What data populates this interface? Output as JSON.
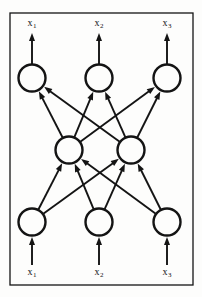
{
  "figure": {
    "kind": "neural-network-diagram",
    "background_color": "#fdfdfc",
    "ink_color": "#141414",
    "frame": {
      "name": "figure-border",
      "x": 10,
      "y": 13,
      "width": 183,
      "height": 272,
      "stroke_width": 1.3
    },
    "style": {
      "node_radius": 13.5,
      "node_stroke_width": 2.4,
      "edge_stroke_width": 1.9,
      "arrow_head_length": 8,
      "arrow_head_width": 6
    },
    "layers": [
      {
        "name": "output-layer",
        "role": "output",
        "y": 78,
        "nodes": [
          {
            "name": "output-node-1",
            "x": 32
          },
          {
            "name": "output-node-2",
            "x": 99
          },
          {
            "name": "output-node-3",
            "x": 167
          }
        ]
      },
      {
        "name": "hidden-layer",
        "role": "hidden",
        "y": 150,
        "nodes": [
          {
            "name": "hidden-node-1",
            "x": 69
          },
          {
            "name": "hidden-node-2",
            "x": 131
          }
        ]
      },
      {
        "name": "input-layer",
        "role": "input",
        "y": 222,
        "nodes": [
          {
            "name": "input-node-1",
            "x": 32
          },
          {
            "name": "input-node-2",
            "x": 99
          },
          {
            "name": "input-node-3",
            "x": 167
          }
        ]
      }
    ],
    "edges": [
      {
        "name": "edge-hidden1-output1",
        "from_layer": 1,
        "from_node": 0,
        "to_layer": 0,
        "to_node": 0
      },
      {
        "name": "edge-hidden1-output2",
        "from_layer": 1,
        "from_node": 0,
        "to_layer": 0,
        "to_node": 1
      },
      {
        "name": "edge-hidden1-output3",
        "from_layer": 1,
        "from_node": 0,
        "to_layer": 0,
        "to_node": 2
      },
      {
        "name": "edge-hidden2-output1",
        "from_layer": 1,
        "from_node": 1,
        "to_layer": 0,
        "to_node": 0
      },
      {
        "name": "edge-hidden2-output2",
        "from_layer": 1,
        "from_node": 1,
        "to_layer": 0,
        "to_node": 1
      },
      {
        "name": "edge-hidden2-output3",
        "from_layer": 1,
        "from_node": 1,
        "to_layer": 0,
        "to_node": 2
      },
      {
        "name": "edge-input1-hidden1",
        "from_layer": 2,
        "from_node": 0,
        "to_layer": 1,
        "to_node": 0
      },
      {
        "name": "edge-input1-hidden2",
        "from_layer": 2,
        "from_node": 0,
        "to_layer": 1,
        "to_node": 1
      },
      {
        "name": "edge-input2-hidden1",
        "from_layer": 2,
        "from_node": 1,
        "to_layer": 1,
        "to_node": 0
      },
      {
        "name": "edge-input2-hidden2",
        "from_layer": 2,
        "from_node": 1,
        "to_layer": 1,
        "to_node": 1
      },
      {
        "name": "edge-input3-hidden1",
        "from_layer": 2,
        "from_node": 2,
        "to_layer": 1,
        "to_node": 0
      },
      {
        "name": "edge-input3-hidden2",
        "from_layer": 2,
        "from_node": 2,
        "to_layer": 1,
        "to_node": 1
      }
    ],
    "output_arrows": [
      {
        "name": "output-arrow-1",
        "x": 32,
        "y_from": 64,
        "y_to": 33
      },
      {
        "name": "output-arrow-2",
        "x": 99,
        "y_from": 64,
        "y_to": 33
      },
      {
        "name": "output-arrow-3",
        "x": 167,
        "y_from": 64,
        "y_to": 33
      }
    ],
    "input_arrows": [
      {
        "name": "input-arrow-1",
        "x": 32,
        "y_from": 265,
        "y_to": 237
      },
      {
        "name": "input-arrow-2",
        "x": 99,
        "y_from": 265,
        "y_to": 237
      },
      {
        "name": "input-arrow-3",
        "x": 167,
        "y_from": 265,
        "y_to": 237
      }
    ],
    "labels": {
      "outputs": [
        {
          "name": "output-label-1",
          "base": "x",
          "sub": "1",
          "x": 32,
          "y": 18
        },
        {
          "name": "output-label-2",
          "base": "x",
          "sub": "2",
          "x": 99,
          "y": 18
        },
        {
          "name": "output-label-3",
          "base": "x",
          "sub": "3",
          "x": 167,
          "y": 18
        }
      ],
      "inputs": [
        {
          "name": "input-label-1",
          "base": "x",
          "sub": "1",
          "x": 32,
          "y": 267
        },
        {
          "name": "input-label-2",
          "base": "x",
          "sub": "2",
          "x": 99,
          "y": 267
        },
        {
          "name": "input-label-3",
          "base": "x",
          "sub": "3",
          "x": 167,
          "y": 267
        }
      ]
    }
  }
}
